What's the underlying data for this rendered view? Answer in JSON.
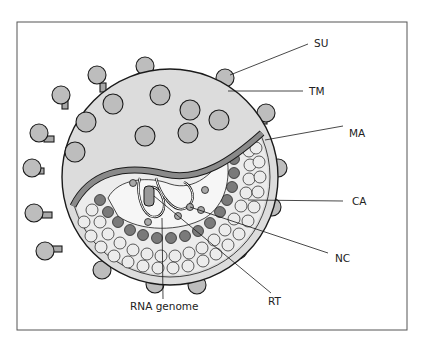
{
  "diagram": {
    "labels": {
      "su": "SU",
      "tm": "TM",
      "ma": "MA",
      "ca": "CA",
      "nc": "NC",
      "rt": "RT",
      "rna": "RNA genome"
    },
    "colors": {
      "envelope_fill": "#dcdcdc",
      "knob_fill": "#bdbdbd",
      "matrix_band": "#8a8a8a",
      "capsid_light": "#ececec",
      "capsid_dark": "#7a7a7a",
      "core_fill": "#f6f6f6",
      "outline": "#1a1a1a"
    }
  }
}
